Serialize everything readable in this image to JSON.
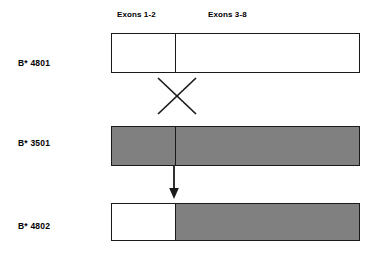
{
  "figure": {
    "colors": {
      "stroke": "#1a1a1a",
      "gray_fill": "#808080",
      "white_fill": "#ffffff",
      "background": "#ffffff"
    }
  },
  "column_headers": [
    {
      "label": "Exons 1-2"
    },
    {
      "label": "Exons 3-8"
    }
  ],
  "alleles": [
    {
      "label": "B* 4801",
      "segments": [
        {
          "region": "Exons 1-2",
          "fill": "white"
        },
        {
          "region": "Exons 3-8",
          "fill": "white"
        }
      ]
    },
    {
      "label": "B* 3501",
      "segments": [
        {
          "region": "Exons 1-2",
          "fill": "gray"
        },
        {
          "region": "Exons 3-8",
          "fill": "gray"
        }
      ]
    },
    {
      "label": "B* 4802",
      "segments": [
        {
          "region": "Exons 1-2",
          "fill": "white"
        },
        {
          "region": "Exons 3-8",
          "fill": "gray"
        }
      ]
    }
  ],
  "annotations": {
    "crossover_symbol": "X",
    "arrow_symbol": "down-arrow"
  }
}
